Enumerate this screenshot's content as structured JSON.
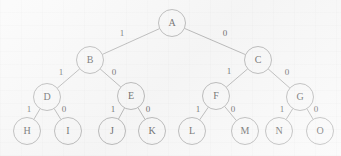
{
  "diagram": {
    "type": "binary-tree",
    "node_radius": 13.5,
    "colors": {
      "background": "#f7f7f7",
      "stroke": "#8e8e8e",
      "text": "#262626"
    },
    "nodes": [
      {
        "id": "A",
        "label": "A",
        "x": 172,
        "y": 23,
        "level": 0
      },
      {
        "id": "B",
        "label": "B",
        "x": 90,
        "y": 60,
        "level": 1
      },
      {
        "id": "C",
        "label": "C",
        "x": 258,
        "y": 60,
        "level": 1
      },
      {
        "id": "D",
        "label": "D",
        "x": 47,
        "y": 97,
        "level": 2
      },
      {
        "id": "E",
        "label": "E",
        "x": 131,
        "y": 96,
        "level": 2
      },
      {
        "id": "F",
        "label": "F",
        "x": 216,
        "y": 96,
        "level": 2
      },
      {
        "id": "G",
        "label": "G",
        "x": 300,
        "y": 97,
        "level": 2
      },
      {
        "id": "H",
        "label": "H",
        "x": 27,
        "y": 131,
        "level": 3
      },
      {
        "id": "I",
        "label": "I",
        "x": 68,
        "y": 131,
        "level": 3
      },
      {
        "id": "J",
        "label": "J",
        "x": 112,
        "y": 131,
        "level": 3
      },
      {
        "id": "K",
        "label": "K",
        "x": 152,
        "y": 131,
        "level": 3
      },
      {
        "id": "L",
        "label": "L",
        "x": 192,
        "y": 131,
        "level": 3
      },
      {
        "id": "M",
        "label": "M",
        "x": 245,
        "y": 131,
        "level": 3
      },
      {
        "id": "N",
        "label": "N",
        "x": 279,
        "y": 131,
        "level": 3
      },
      {
        "id": "O",
        "label": "O",
        "x": 320,
        "y": 131,
        "level": 3
      }
    ],
    "edges": [
      {
        "from": "A",
        "to": "B",
        "label": "1",
        "lx": 122,
        "ly": 34
      },
      {
        "from": "A",
        "to": "C",
        "label": "0",
        "lx": 225,
        "ly": 34
      },
      {
        "from": "B",
        "to": "D",
        "label": "1",
        "lx": 61,
        "ly": 73
      },
      {
        "from": "B",
        "to": "E",
        "label": "0",
        "lx": 114,
        "ly": 73
      },
      {
        "from": "C",
        "to": "F",
        "label": "1",
        "lx": 229,
        "ly": 72
      },
      {
        "from": "C",
        "to": "G",
        "label": "0",
        "lx": 287,
        "ly": 73
      },
      {
        "from": "D",
        "to": "H",
        "label": "1",
        "lx": 29,
        "ly": 110
      },
      {
        "from": "D",
        "to": "I",
        "label": "0",
        "lx": 64,
        "ly": 110
      },
      {
        "from": "E",
        "to": "J",
        "label": "1",
        "lx": 113,
        "ly": 110
      },
      {
        "from": "E",
        "to": "K",
        "label": "0",
        "lx": 148,
        "ly": 110
      },
      {
        "from": "F",
        "to": "L",
        "label": "1",
        "lx": 198,
        "ly": 110
      },
      {
        "from": "F",
        "to": "M",
        "label": "0",
        "lx": 233,
        "ly": 110
      },
      {
        "from": "G",
        "to": "N",
        "label": "1",
        "lx": 282,
        "ly": 110
      },
      {
        "from": "G",
        "to": "O",
        "label": "0",
        "lx": 316,
        "ly": 110
      }
    ]
  }
}
